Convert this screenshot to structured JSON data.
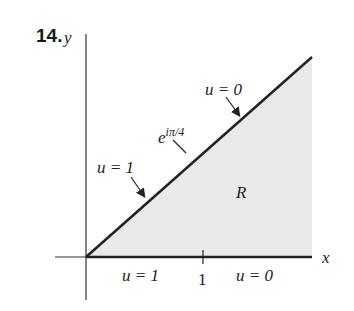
{
  "problem_number": "14.",
  "axes": {
    "x_label": "x",
    "y_label": "y"
  },
  "region_label": "R",
  "tick_label_x": "1",
  "point_label": {
    "base": "e",
    "exponent": "iπ/4"
  },
  "boundary_labels": {
    "diagonal_upper": "u = 0",
    "diagonal_lower": "u = 1",
    "xaxis_left": "u = 1",
    "xaxis_right": "u = 0"
  },
  "colors": {
    "fill": "#e9e9e9",
    "stroke": "#222222"
  }
}
